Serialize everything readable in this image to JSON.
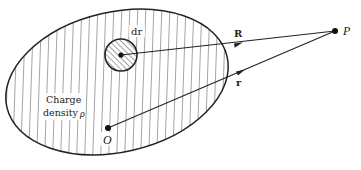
{
  "diagram": {
    "region": {
      "label_line1": "Charge",
      "label_line2": "density",
      "label_symbol": "ρ"
    },
    "volume_element": {
      "label": "dr"
    },
    "vectors": {
      "R": {
        "label": "R"
      },
      "r": {
        "label": "r"
      }
    },
    "points": {
      "field_point": {
        "label": "P"
      },
      "origin": {
        "label": "O"
      }
    },
    "colors": {
      "stroke": "#222222",
      "background": "#ffffff"
    }
  }
}
